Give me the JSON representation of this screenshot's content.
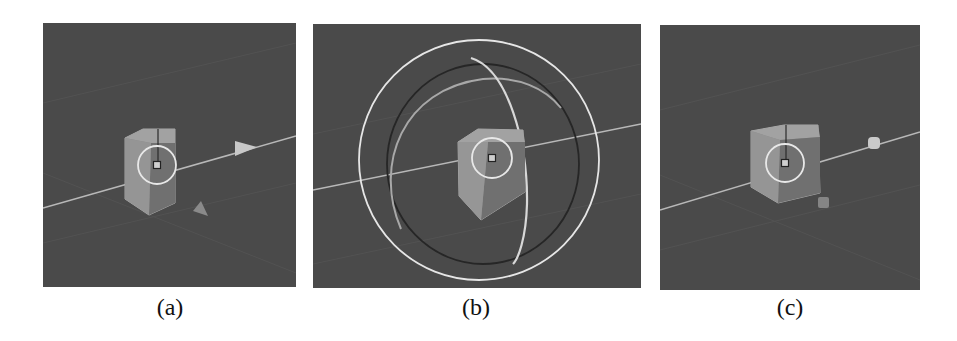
{
  "figure": {
    "panels": [
      {
        "id": "a",
        "caption": "(a)",
        "gizmo": "translate",
        "description": "Cube with translate handles: arrow cone on axis and a secondary cone handle"
      },
      {
        "id": "b",
        "caption": "(b)",
        "gizmo": "rotate",
        "description": "Cube with rotation rings around it"
      },
      {
        "id": "c",
        "caption": "(c)",
        "gizmo": "scale",
        "description": "Cube with scale handles: square/box handles on axis"
      }
    ],
    "colors": {
      "viewport_bg": "#4a4a4a",
      "grid_line": "#5a5a5a",
      "axis_line": "#b8b8b8",
      "cube_light": "#9a9a9a",
      "cube_dark": "#7a7a7a",
      "ring": "#e8e8e8",
      "handle": "#c8c8c8",
      "handle_dark": "#8a8a8a"
    }
  }
}
